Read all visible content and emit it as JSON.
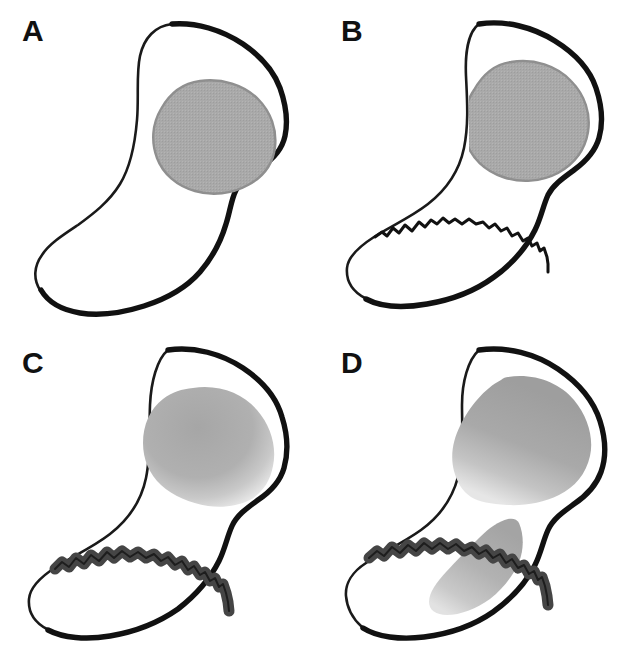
{
  "figure": {
    "background_color": "#ffffff",
    "width": 637,
    "height": 663,
    "panel_count": 4
  },
  "palette": {
    "outline_dark": "#111111",
    "outline_thin": "#1a1a1a",
    "lesion_gray": "#a8a8a8",
    "lesion_gray_border": "#8f8f8f",
    "lesion_gray_light": "#c2c2c2",
    "fracture_band_dark": "#454545",
    "bone_fill": "#ffffff",
    "label_color": "#111111"
  },
  "panels": [
    {
      "id": "a",
      "label": "A",
      "caption": "Intact bone outline with rounded gray lesion in the head region",
      "has_fracture_line": false,
      "has_fracture_band": false,
      "lesion_style": "solid-bordered",
      "lesion_count": 1
    },
    {
      "id": "b",
      "label": "B",
      "caption": "Thin jagged fracture line crossing the neck and the inferior lesion margin",
      "has_fracture_line": true,
      "has_fracture_band": false,
      "lesion_style": "solid-bordered",
      "lesion_count": 1
    },
    {
      "id": "c",
      "label": "C",
      "caption": "Widened dark fracture band with diffuse fading gray lesion above",
      "has_fracture_line": false,
      "has_fracture_band": true,
      "lesion_style": "diffuse-gradient",
      "lesion_count": 1
    },
    {
      "id": "d",
      "label": "D",
      "caption": "Expanded gray region above and tapering gray tongue below the dark fracture band",
      "has_fracture_line": false,
      "has_fracture_band": true,
      "lesion_style": "diffuse-gradient",
      "lesion_count": 2
    }
  ]
}
